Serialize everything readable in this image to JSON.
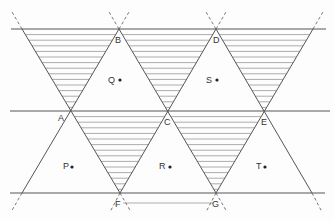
{
  "diagram": {
    "colors": {
      "line": "#555555",
      "hatch": "#8a8a8a",
      "background": "#fdfdfd",
      "text": "#333333"
    },
    "horizontal_lines_y": [
      29,
      111,
      193
    ],
    "vertices": [
      {
        "id": "A",
        "label": "A",
        "x": 71,
        "y": 111
      },
      {
        "id": "B",
        "label": "B",
        "x": 119,
        "y": 29
      },
      {
        "id": "C",
        "label": "C",
        "x": 168,
        "y": 111
      },
      {
        "id": "D",
        "label": "D",
        "x": 216,
        "y": 29
      },
      {
        "id": "E",
        "label": "E",
        "x": 264,
        "y": 111
      },
      {
        "id": "F",
        "label": "F",
        "x": 120,
        "y": 193
      },
      {
        "id": "G",
        "label": "G",
        "x": 216,
        "y": 193
      }
    ],
    "points": [
      {
        "id": "Q",
        "label": "Q",
        "x": 120,
        "y": 80
      },
      {
        "id": "S",
        "label": "S",
        "x": 217,
        "y": 80
      },
      {
        "id": "P",
        "label": "P",
        "x": 72,
        "y": 167
      },
      {
        "id": "R",
        "label": "R",
        "x": 170,
        "y": 167
      },
      {
        "id": "T",
        "label": "T",
        "x": 265,
        "y": 167
      }
    ],
    "shaded_triangles": [
      {
        "name": "top-left",
        "vertices": [
          [
            22,
            29
          ],
          [
            119,
            29
          ],
          [
            71,
            111
          ]
        ]
      },
      {
        "name": "B-D-C",
        "vertices": [
          [
            119,
            29
          ],
          [
            216,
            29
          ],
          [
            168,
            111
          ]
        ]
      },
      {
        "name": "top-right",
        "vertices": [
          [
            216,
            29
          ],
          [
            313,
            29
          ],
          [
            264,
            111
          ]
        ]
      },
      {
        "name": "A-C-F",
        "vertices": [
          [
            71,
            111
          ],
          [
            168,
            111
          ],
          [
            120,
            193
          ]
        ]
      },
      {
        "name": "C-E-G",
        "vertices": [
          [
            168,
            111
          ],
          [
            264,
            111
          ],
          [
            216,
            193
          ]
        ]
      }
    ],
    "hatch_spacing": 5.6
  }
}
